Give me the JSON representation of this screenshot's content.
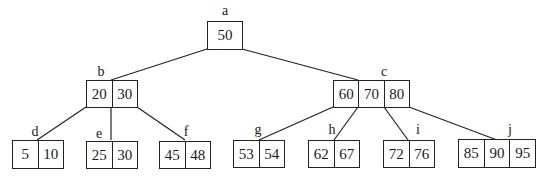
{
  "diagram": {
    "type": "b-tree",
    "nodes": {
      "a": {
        "label": "a",
        "keys": [
          "50"
        ]
      },
      "b": {
        "label": "b",
        "keys": [
          "20",
          "30"
        ]
      },
      "c": {
        "label": "c",
        "keys": [
          "60",
          "70",
          "80"
        ]
      },
      "d": {
        "label": "d",
        "keys": [
          "5",
          "10"
        ]
      },
      "e": {
        "label": "e",
        "keys": [
          "25",
          "30"
        ]
      },
      "f": {
        "label": "f",
        "keys": [
          "45",
          "48"
        ]
      },
      "g": {
        "label": "g",
        "keys": [
          "53",
          "54"
        ]
      },
      "h": {
        "label": "h",
        "keys": [
          "62",
          "67"
        ]
      },
      "i": {
        "label": "i",
        "keys": [
          "72",
          "76"
        ]
      },
      "j": {
        "label": "j",
        "keys": [
          "85",
          "90",
          "95"
        ]
      }
    },
    "edges": [
      [
        "a",
        "b"
      ],
      [
        "a",
        "c"
      ],
      [
        "b",
        "d"
      ],
      [
        "b",
        "e"
      ],
      [
        "b",
        "f"
      ],
      [
        "c",
        "g"
      ],
      [
        "c",
        "h"
      ],
      [
        "c",
        "i"
      ],
      [
        "c",
        "j"
      ]
    ],
    "line_color": "#222222"
  }
}
